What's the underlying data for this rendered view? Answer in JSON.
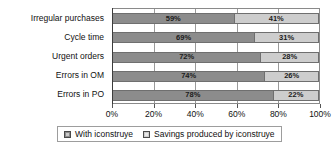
{
  "chart_data": {
    "type": "bar",
    "orientation": "horizontal",
    "stacked": true,
    "normalized": true,
    "title": "",
    "xlabel": "",
    "ylabel": "",
    "xlim": [
      0,
      100
    ],
    "xticks": [
      0,
      20,
      40,
      60,
      80,
      100
    ],
    "xtick_labels": [
      "0%",
      "20%",
      "40%",
      "60%",
      "80%",
      "100%"
    ],
    "grid": true,
    "legend_position": "bottom",
    "categories": [
      "Irregular purchases",
      "Cycle  time",
      "Urgent  orders",
      "Errors in OM",
      "Errors in PO"
    ],
    "series": [
      {
        "name": "With iconstruye",
        "color": "#8c8c8c",
        "values": [
          59,
          69,
          72,
          74,
          78
        ],
        "labels": [
          "59%",
          "69%",
          "72%",
          "74%",
          "78%"
        ]
      },
      {
        "name": "Savings produced by iconstruye",
        "color": "#cdcdcd",
        "values": [
          41,
          31,
          28,
          26,
          22
        ],
        "labels": [
          "41%",
          "31%",
          "28%",
          "26%",
          "22%"
        ]
      }
    ]
  },
  "legend": {
    "items": [
      {
        "label": "With iconstruye",
        "swatch": "legend-swatch-with-iconstruye"
      },
      {
        "label": "Savings produced by iconstruye",
        "swatch": "legend-swatch-savings"
      }
    ]
  }
}
